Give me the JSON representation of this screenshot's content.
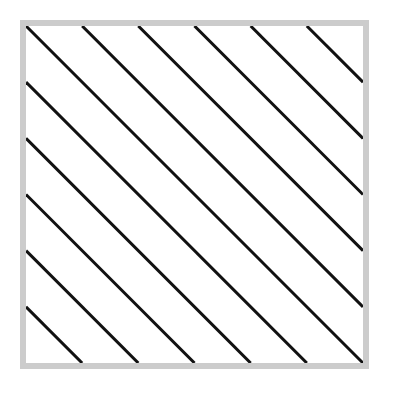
{
  "diagram": {
    "shape": "square",
    "frame": {
      "border_color": "#cccccc",
      "fill_color": "#ffffff",
      "border_width": 6
    },
    "hatch": {
      "angle_degrees": -45,
      "line_color": "#111111",
      "line_width": 3,
      "line_count": 11,
      "spacing_fraction": 0.1667
    }
  }
}
